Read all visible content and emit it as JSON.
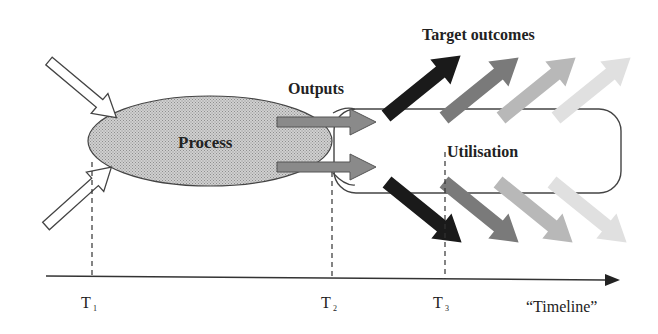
{
  "diagram": {
    "labels": {
      "process": "Process",
      "outputs": "Outputs",
      "target_outcomes": "Target outcomes",
      "utilisation": "Utilisation",
      "timeline": "“Timeline”"
    },
    "time_marks": [
      {
        "base": "T",
        "sub": "1"
      },
      {
        "base": "T",
        "sub": "2"
      },
      {
        "base": "T",
        "sub": "3"
      }
    ],
    "colors": {
      "process_fill": "#bdbdbd",
      "output_arrow_fill": "#8a8a8a",
      "outcome_arrow_shades": [
        "#1a1a1a",
        "#7a7a7a",
        "#b5b5b5",
        "#dedede"
      ],
      "line": "#333333"
    }
  }
}
